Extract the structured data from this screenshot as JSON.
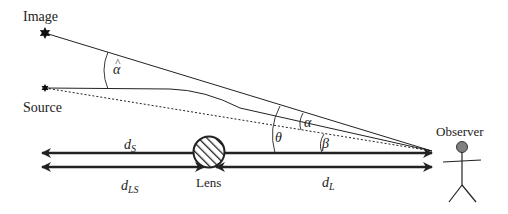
{
  "labels": {
    "image": "Image",
    "source": "Source",
    "observer": "Observer",
    "lens": "Lens",
    "alpha_hat": "α",
    "alpha_hat_accent": "^",
    "alpha": "α",
    "theta": "θ",
    "beta": "β",
    "d_s_main": "d",
    "d_s_sub": "S",
    "d_ls_main": "d",
    "d_ls_sub": "LS",
    "d_l_main": "d",
    "d_l_sub": "L"
  },
  "colors": {
    "line": "#222222",
    "observer_head": "#808080",
    "background": "#ffffff"
  }
}
